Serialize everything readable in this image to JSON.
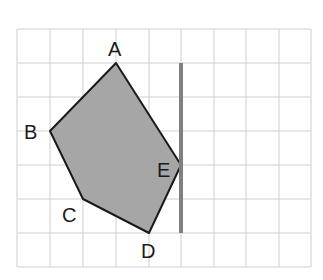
{
  "diagram": {
    "grid": {
      "cols": 9,
      "rows": 7,
      "origin_x": 17,
      "origin_y": 29,
      "cell_w": 32.7,
      "cell_h": 34,
      "line_color": "#cfcfcf"
    },
    "polygon": {
      "fill": "#a6a6a6",
      "stroke": "#1a1a1a",
      "vertices": [
        {
          "label": "A",
          "x": 116,
          "y": 63
        },
        {
          "label": "E",
          "x": 181,
          "y": 165
        },
        {
          "label": "D",
          "x": 149,
          "y": 233
        },
        {
          "label": "C",
          "x": 83,
          "y": 199
        },
        {
          "label": "B",
          "x": 50,
          "y": 131
        }
      ]
    },
    "mirror_line": {
      "x": 181,
      "y1": 63,
      "y2": 233,
      "color": "#808080"
    },
    "labels": {
      "A": "A",
      "B": "B",
      "C": "C",
      "D": "D",
      "E": "E"
    }
  }
}
